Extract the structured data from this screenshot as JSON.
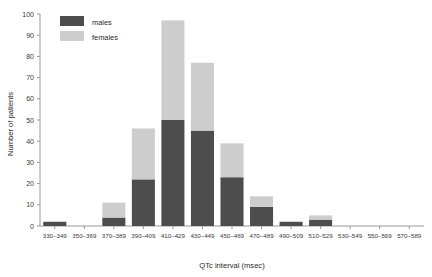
{
  "chart_data": {
    "type": "bar",
    "subtype": "stacked-histogram",
    "title": "",
    "xlabel": "QTc interval (msec)",
    "ylabel": "Number of patients",
    "categories": [
      "330–349",
      "350–369",
      "370–389",
      "390–409",
      "410–429",
      "430–449",
      "450–469",
      "470–489",
      "490–509",
      "510–529",
      "530–549",
      "550–569",
      "570–589"
    ],
    "series": [
      {
        "name": "males",
        "color": "#4d4d4d",
        "values": [
          2,
          0,
          4,
          22,
          50,
          45,
          23,
          9,
          2,
          3,
          0,
          0,
          0
        ]
      },
      {
        "name": "females",
        "color": "#cdcdcd",
        "values": [
          0,
          0,
          7,
          24,
          47,
          32,
          16,
          5,
          0,
          2,
          0,
          0,
          0
        ]
      }
    ],
    "totals": [
      2,
      0,
      11,
      46,
      97,
      77,
      39,
      14,
      2,
      5,
      0,
      0,
      0
    ],
    "ylim": [
      0,
      100
    ],
    "yticks": [
      0,
      10,
      20,
      30,
      40,
      50,
      60,
      70,
      80,
      90,
      100
    ],
    "ytick_labels": [
      "0",
      "10",
      "20",
      "30",
      "40",
      "50",
      "60",
      "70",
      "80",
      "90",
      "100"
    ],
    "grid": false,
    "legend_position": "top-left",
    "legend_entries": [
      {
        "label": "males",
        "color": "#4d4d4d"
      },
      {
        "label": "females",
        "color": "#cdcdcd"
      }
    ]
  }
}
